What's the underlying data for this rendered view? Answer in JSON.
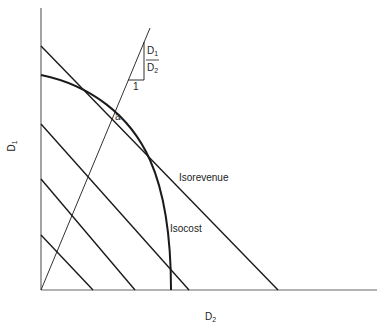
{
  "diagram": {
    "axes": {
      "x_label": "D",
      "x_label_sub": "2",
      "y_label": "D",
      "y_label_sub": "1"
    },
    "curves": {
      "isorevenue_label": "Isorevenue",
      "isocost_label": "Isocost"
    },
    "point": {
      "label": "a"
    },
    "slope_triangle": {
      "numerator": "D",
      "numerator_sub": "1",
      "denominator": "D",
      "denominator_sub": "2",
      "run_label": "1"
    },
    "colors": {
      "line": "#1a1a1a",
      "axis": "#555555",
      "background": "#ffffff"
    }
  }
}
